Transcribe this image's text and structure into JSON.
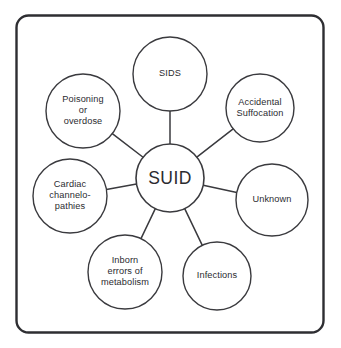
{
  "diagram": {
    "type": "hub-and-spoke",
    "title": "SUID",
    "frame": {
      "shape": "rounded-rectangle",
      "stroke_color": "#2e2e32",
      "background_color": "#ffffff"
    },
    "hub": {
      "id": "suid",
      "label": "SUID",
      "cx": 170,
      "cy": 178,
      "r": 34
    },
    "nodes": [
      {
        "id": "sids",
        "label": "SIDS",
        "cx": 170,
        "cy": 74,
        "r": 37
      },
      {
        "id": "accidental-suffocation",
        "label": "Accidental\nSuffocation",
        "cx": 260,
        "cy": 108,
        "r": 34
      },
      {
        "id": "unknown",
        "label": "Unknown",
        "cx": 272,
        "cy": 200,
        "r": 36
      },
      {
        "id": "infections",
        "label": "Infections",
        "cx": 217,
        "cy": 276,
        "r": 34
      },
      {
        "id": "inborn-errors-of-metabolism",
        "label": "Inborn\nerrors of\nmetabolism",
        "cx": 125,
        "cy": 272,
        "r": 37
      },
      {
        "id": "cardiac-channelopathies",
        "label": "Cardiac\nchannelo-\npathies",
        "cx": 70,
        "cy": 196,
        "r": 37
      },
      {
        "id": "poisoning-or-overdose",
        "label": "Poisoning\nor\noverdose",
        "cx": 83,
        "cy": 111,
        "r": 37
      }
    ],
    "colors": {
      "node_stroke": "#3a3a3e",
      "spoke_stroke": "#3a3a3e",
      "text": "#2b2b30"
    }
  }
}
